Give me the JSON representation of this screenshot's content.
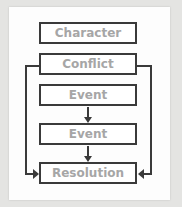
{
  "diagram": {
    "nodes": [
      {
        "id": "character",
        "label": "Character"
      },
      {
        "id": "conflict",
        "label": "Conflict"
      },
      {
        "id": "event1",
        "label": "Event"
      },
      {
        "id": "event2",
        "label": "Event"
      },
      {
        "id": "resolution",
        "label": "Resolution"
      }
    ],
    "edges": [
      {
        "from": "event1",
        "to": "event2"
      },
      {
        "from": "event2",
        "to": "resolution"
      },
      {
        "from": "conflict",
        "to": "resolution",
        "side": "left"
      },
      {
        "from": "conflict",
        "to": "resolution",
        "side": "right"
      }
    ],
    "colors": {
      "stroke": "#3a3a3a",
      "label": "#a6a6a6",
      "card": "#fdfdfd",
      "background": "#e4e4e2"
    }
  }
}
